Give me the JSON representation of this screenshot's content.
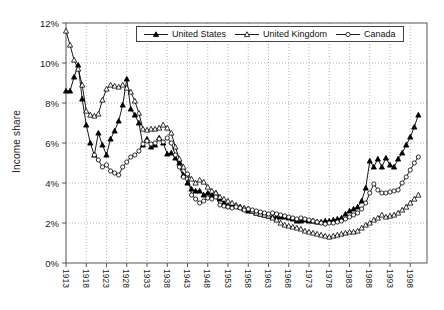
{
  "figure": {
    "y_axis_title": "Income share",
    "background_color": "#ffffff",
    "frame_color": "#555555",
    "grid_color": "#b5b5b5",
    "series_color": "#000000",
    "text_color": "#1a1a1a"
  },
  "legend": {
    "items": [
      {
        "label": "United States",
        "marker": "filled-triangle"
      },
      {
        "label": "United Kingdom",
        "marker": "open-triangle"
      },
      {
        "label": "Canada",
        "marker": "open-circle"
      }
    ]
  },
  "chart_data": {
    "type": "line",
    "title": "",
    "xlabel": "",
    "ylabel": "Income share",
    "ylim": [
      0,
      12
    ],
    "x_range_years": [
      1913,
      2002
    ],
    "grid": "dotted",
    "legend_position": "top-center-inside",
    "y_tick_values": [
      0,
      2,
      4,
      6,
      8,
      10,
      12
    ],
    "y_tick_labels": [
      "0%",
      "2%",
      "4%",
      "6%",
      "8%",
      "10%",
      "12%"
    ],
    "x_tick_years": [
      1913,
      1918,
      1923,
      1928,
      1933,
      1938,
      1943,
      1948,
      1953,
      1958,
      1963,
      1968,
      1973,
      1978,
      1983,
      1988,
      1993,
      1998
    ],
    "series": [
      {
        "name": "United States",
        "marker": "filled-triangle",
        "start_year": 1913,
        "values": [
          8.6,
          8.6,
          9.3,
          9.9,
          8.2,
          6.9,
          6.0,
          5.4,
          6.5,
          5.9,
          5.4,
          6.2,
          6.6,
          7.1,
          7.9,
          9.2,
          7.7,
          7.4,
          7.0,
          5.9,
          6.2,
          5.8,
          5.9,
          6.25,
          6.0,
          5.45,
          5.5,
          5.25,
          5.0,
          4.4,
          4.0,
          3.7,
          3.6,
          3.6,
          3.4,
          3.5,
          3.4,
          3.5,
          3.2,
          3.0,
          2.85,
          2.9,
          2.85,
          2.8,
          2.7,
          2.6,
          2.6,
          2.5,
          2.45,
          2.4,
          2.35,
          2.3,
          2.3,
          2.3,
          2.3,
          2.25,
          2.2,
          2.1,
          2.1,
          2.15,
          2.1,
          2.1,
          2.05,
          2.05,
          2.1,
          2.1,
          2.15,
          2.2,
          2.25,
          2.45,
          2.6,
          2.7,
          2.8,
          3.1,
          3.75,
          5.1,
          4.8,
          5.2,
          4.8,
          5.25,
          4.9,
          4.8,
          5.2,
          5.5,
          5.9,
          6.3,
          6.8,
          7.4
        ]
      },
      {
        "name": "United Kingdom",
        "marker": "open-triangle",
        "start_year": 1913,
        "values": [
          11.6,
          10.9,
          10.15,
          9.7,
          8.9,
          7.6,
          7.4,
          7.35,
          7.45,
          8.15,
          8.7,
          8.9,
          8.85,
          8.8,
          8.9,
          8.75,
          8.55,
          8.1,
          7.5,
          6.7,
          6.65,
          6.7,
          6.7,
          6.75,
          6.9,
          6.75,
          6.5,
          5.8,
          5.2,
          4.8,
          4.4,
          4.2,
          4.0,
          4.15,
          4.05,
          3.8,
          3.6,
          3.5,
          3.3,
          3.2,
          3.1,
          3.0,
          2.9,
          2.8,
          2.75,
          2.7,
          2.6,
          2.5,
          2.45,
          2.4,
          2.35,
          2.25,
          2.15,
          2.0,
          1.9,
          1.85,
          1.8,
          1.75,
          1.7,
          1.6,
          1.55,
          1.5,
          1.45,
          1.4,
          1.35,
          1.3,
          1.35,
          1.4,
          1.45,
          1.5,
          1.55,
          1.55,
          1.6,
          1.75,
          1.9,
          2.0,
          2.15,
          2.25,
          2.4,
          2.3,
          2.35,
          2.4,
          2.5,
          2.65,
          2.8,
          3.0,
          3.2,
          3.4
        ]
      },
      {
        "name": "Canada",
        "marker": "open-circle",
        "start_year": 1920,
        "values": [
          5.4,
          5.15,
          4.8,
          4.9,
          4.6,
          4.5,
          4.4,
          4.8,
          5.05,
          5.3,
          5.4,
          5.6,
          5.95,
          6.1,
          5.95,
          6.0,
          6.2,
          6.05,
          6.25,
          6.0,
          5.4,
          4.8,
          4.3,
          4.45,
          3.4,
          3.2,
          3.0,
          3.1,
          3.25,
          3.2,
          3.3,
          2.9,
          2.85,
          2.8,
          2.75,
          2.8,
          2.75,
          2.65,
          2.7,
          2.65,
          2.6,
          2.55,
          2.5,
          2.45,
          2.5,
          2.45,
          2.4,
          2.35,
          2.3,
          2.25,
          2.2,
          2.25,
          2.2,
          2.15,
          2.1,
          2.05,
          2.0,
          1.95,
          2.0,
          2.0,
          2.05,
          2.1,
          2.2,
          2.3,
          2.4,
          2.5,
          2.7,
          3.0,
          3.5,
          3.95,
          3.65,
          3.5,
          3.5,
          3.55,
          3.6,
          3.65,
          4.0,
          4.3,
          4.65,
          5.0,
          5.3
        ]
      }
    ]
  }
}
